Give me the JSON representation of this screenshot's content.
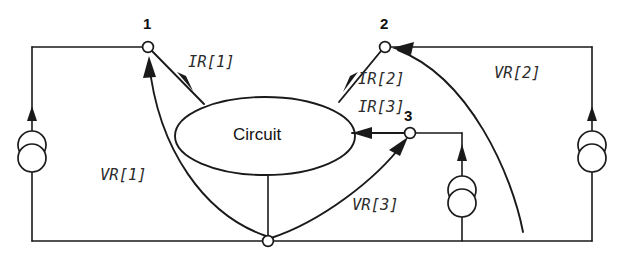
{
  "diagram": {
    "type": "circuit-schematic",
    "background_color": "#ffffff",
    "line_color": "#1a1a1a",
    "block": {
      "label": "Circuit",
      "shape": "ellipse"
    },
    "nodes": [
      {
        "id": "node-1",
        "label": "1",
        "x": 148,
        "y": 47
      },
      {
        "id": "node-2",
        "label": "2",
        "x": 385,
        "y": 47
      },
      {
        "id": "node-3",
        "label": "3",
        "x": 410,
        "y": 133
      },
      {
        "id": "node-ground",
        "label": "",
        "x": 268,
        "y": 241
      }
    ],
    "current_labels": [
      {
        "id": "ir1",
        "text": "IR[1]",
        "x": 188,
        "y": 55
      },
      {
        "id": "ir2",
        "text": "IR[2]",
        "x": 358,
        "y": 72
      },
      {
        "id": "ir3",
        "text": "IR[3]",
        "x": 358,
        "y": 100
      }
    ],
    "voltage_labels": [
      {
        "id": "vr1",
        "text": "VR[1]",
        "x": 100,
        "y": 168
      },
      {
        "id": "vr2",
        "text": "VR[2]",
        "x": 494,
        "y": 66
      },
      {
        "id": "vr3",
        "text": "VR[3]",
        "x": 352,
        "y": 198
      }
    ],
    "sources": [
      {
        "id": "source-left",
        "x": 32,
        "y": 145,
        "direction": "up"
      },
      {
        "id": "source-middle",
        "x": 462,
        "y": 190,
        "direction": "up"
      },
      {
        "id": "source-right",
        "x": 592,
        "y": 145,
        "direction": "up"
      }
    ]
  }
}
